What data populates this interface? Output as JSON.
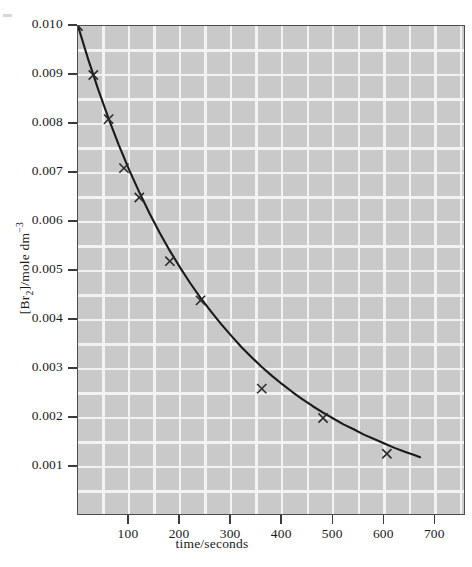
{
  "figure": {
    "background_color": "#ffffff",
    "plot_background_color": "#c9c9c9",
    "grid_color": "#f2f2f2",
    "axis_color": "#4d4d4d",
    "curve_color": "#1a1a1a",
    "marker_color": "#2b2b2b"
  },
  "chart_data": {
    "type": "line",
    "title": "",
    "xlabel": "time/seconds",
    "ylabel": "[Br2]/mole dm-3",
    "ylabel_parts": {
      "species_open": "[Br",
      "species_sub": "2",
      "species_close": "]/mole dm",
      "exponent": "−3"
    },
    "xlim": [
      0,
      760
    ],
    "ylim": [
      0.0,
      0.01
    ],
    "grid": true,
    "grid_spacing_x": 50,
    "grid_spacing_y": 0.0005,
    "legend": "none",
    "xticks": [
      100,
      200,
      300,
      400,
      500,
      600,
      700
    ],
    "xticklabels": [
      "100",
      "200",
      "300",
      "400",
      "500",
      "600",
      "700"
    ],
    "yticks": [
      0.001,
      0.002,
      0.003,
      0.004,
      0.005,
      0.006,
      0.007,
      0.008,
      0.009,
      0.01
    ],
    "yticklabels": [
      "0.001",
      "0.002",
      "0.003",
      "0.004",
      "0.005",
      "0.006",
      "0.007",
      "0.008",
      "0.009",
      "0.010"
    ],
    "series": [
      {
        "name": "[Br2] decay",
        "marker": "x",
        "x": [
          0,
          30,
          60,
          90,
          120,
          180,
          240,
          360,
          480,
          605
        ],
        "y": [
          0.01,
          0.009,
          0.0081,
          0.0071,
          0.0065,
          0.0052,
          0.0044,
          0.0026,
          0.002,
          0.00127
        ]
      }
    ],
    "fitted_curve": {
      "name": "smooth fitted decay curve",
      "x": [
        0,
        20,
        40,
        60,
        80,
        100,
        120,
        140,
        160,
        180,
        200,
        220,
        240,
        260,
        280,
        300,
        320,
        340,
        360,
        380,
        400,
        420,
        440,
        460,
        480,
        500,
        520,
        540,
        560,
        580,
        600,
        620,
        640,
        660,
        670
      ],
      "y": [
        0.01,
        0.00932,
        0.00869,
        0.00811,
        0.00757,
        0.00707,
        0.00661,
        0.00618,
        0.00578,
        0.00541,
        0.00507,
        0.00475,
        0.00445,
        0.00418,
        0.00392,
        0.00368,
        0.00345,
        0.00324,
        0.00304,
        0.00286,
        0.00269,
        0.00253,
        0.00238,
        0.00224,
        0.00211,
        0.00199,
        0.00187,
        0.00177,
        0.00166,
        0.00157,
        0.00148,
        0.00139,
        0.00131,
        0.00124,
        0.0012
      ]
    }
  }
}
